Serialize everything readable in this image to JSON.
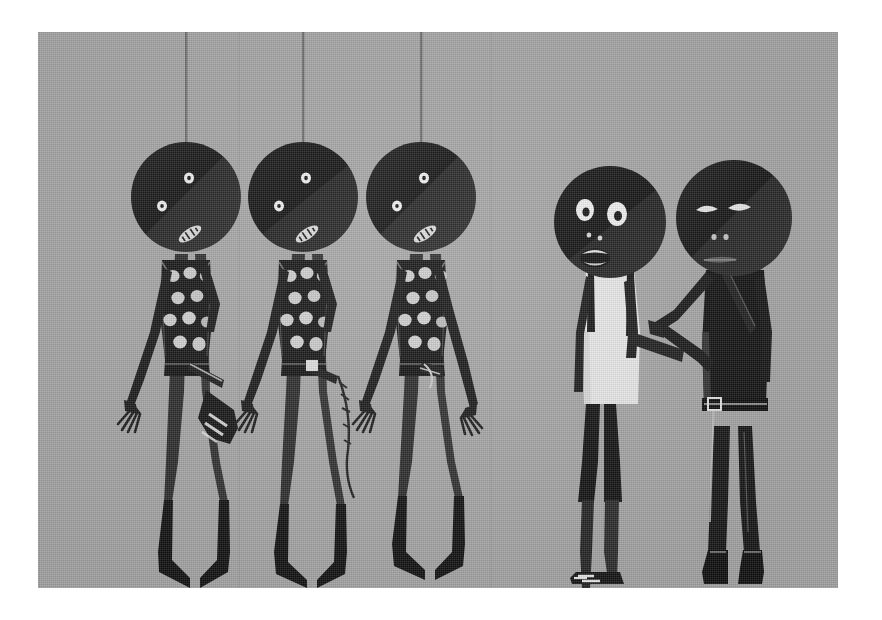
{
  "artwork": {
    "title": "Three Hanging Figures and Two Standing Figures",
    "medium_note": "monochrome illustration on textured grey ground",
    "caption": "",
    "palette": {
      "paper_border": "#ffffff",
      "background_grey": "#a8a8a8",
      "figure_black": "#121212",
      "figure_dark": "#1c1c1c",
      "highlight_white": "#f2f2f2",
      "shirt_white": "#ededed",
      "rope_grey": "#7a7a7a",
      "shadow_grey": "#8f8f8f"
    },
    "canvas": {
      "x": 38,
      "y": 32,
      "width": 800,
      "height": 556
    },
    "ropes": [
      {
        "name": "rope-left",
        "x": 148,
        "top": 0,
        "bottom": 118
      },
      {
        "name": "rope-middle",
        "x": 265,
        "top": 0,
        "bottom": 118
      },
      {
        "name": "rope-right",
        "x": 383,
        "top": 0,
        "bottom": 118
      }
    ],
    "hanging_figures": [
      {
        "id": "hanging-figure-1",
        "label": "Hanging figure 1",
        "head_cx": 148,
        "head_cy": 165,
        "head_r": 55,
        "torso_pattern": "polka-dots",
        "dot_count": 9,
        "has_sneaker": true,
        "eyes": "two small white dots",
        "mouth": "small striped oval"
      },
      {
        "id": "hanging-figure-2",
        "label": "Hanging figure 2",
        "head_cx": 265,
        "head_cy": 165,
        "head_r": 55,
        "torso_pattern": "polka-dots",
        "dot_count": 9,
        "has_sneaker": false,
        "eyes": "two small white dots",
        "mouth": "small striped oval"
      },
      {
        "id": "hanging-figure-3",
        "label": "Hanging figure 3",
        "head_cx": 383,
        "head_cy": 165,
        "head_r": 55,
        "torso_pattern": "polka-dots",
        "dot_count": 9,
        "has_sneaker": false,
        "eyes": "two small white dots",
        "mouth": "small striped oval"
      }
    ],
    "standing_figures": [
      {
        "id": "standing-figure-white-tank",
        "label": "Standing figure in white tank top",
        "head_cx": 572,
        "head_cy": 190,
        "head_r": 56,
        "garment": "white tank top",
        "garment_color": "#ededed",
        "lower_garment": "black shorts",
        "expression": "wide open eyes, open mouth",
        "footwear": "striped sneaker"
      },
      {
        "id": "standing-figure-dark-coat",
        "label": "Standing figure in dark jacket with belt",
        "head_cx": 696,
        "head_cy": 186,
        "head_r": 58,
        "garment": "dark jacket",
        "garment_color": "#121212",
        "lower_garment": "dark trousers",
        "expression": "narrow slit eyes, straight mouth",
        "accessory": "belt with square buckle",
        "footwear": "dark boots"
      }
    ],
    "dot_rows": [
      {
        "cx": -13,
        "cy": 18
      },
      {
        "cx": 4,
        "cy": 16
      },
      {
        "cx": 20,
        "cy": 18
      },
      {
        "cx": -9,
        "cy": 40
      },
      {
        "cx": 9,
        "cy": 38
      },
      {
        "cx": -15,
        "cy": 62
      },
      {
        "cx": 3,
        "cy": 60
      },
      {
        "cx": 20,
        "cy": 62
      },
      {
        "cx": -5,
        "cy": 84
      },
      {
        "cx": 13,
        "cy": 86
      }
    ]
  }
}
